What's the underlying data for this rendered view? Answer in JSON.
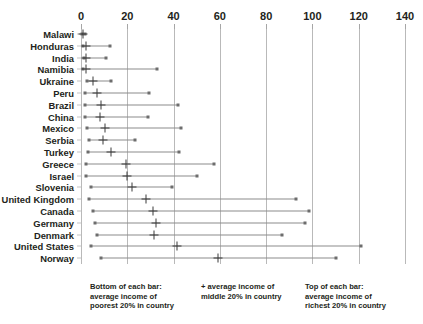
{
  "chart_data": {
    "type": "scatter",
    "title": "",
    "xlabel": "",
    "ylabel": "",
    "xlim": [
      0,
      140
    ],
    "xticks": [
      0,
      20,
      40,
      60,
      80,
      100,
      120,
      140
    ],
    "grid": true,
    "orientation": "horizontal",
    "legend_position": "bottom",
    "categories": [
      "Malawi",
      "Honduras",
      "India",
      "Namibia",
      "Ukraine",
      "Peru",
      "Brazil",
      "China",
      "Mexico",
      "Serbia",
      "Turkey",
      "Greece",
      "Israel",
      "Slovenia",
      "United Kingdom",
      "Canada",
      "Germany",
      "Denmark",
      "United States",
      "Norway"
    ],
    "series": [
      {
        "name": "average income of poorest 20% in country",
        "marker": "square",
        "role": "bar-bottom",
        "values": [
          0.4,
          0.9,
          1.2,
          1.0,
          2.8,
          1.8,
          1.6,
          1.8,
          2.5,
          3.4,
          2.9,
          2.3,
          2.1,
          4.5,
          3.6,
          5.3,
          6.2,
          6.8,
          4.5,
          8.5
        ]
      },
      {
        "name": "average income of middle 20% in country",
        "marker": "plus",
        "role": "bar-middle",
        "values": [
          0.9,
          2.0,
          2.2,
          2.2,
          5.0,
          7.0,
          8.5,
          8.0,
          10.5,
          9.5,
          13.0,
          19.5,
          20.0,
          22.0,
          28.0,
          31.0,
          32.5,
          31.5,
          41.5,
          59.0
        ]
      },
      {
        "name": "average income of richest 20% in country",
        "marker": "square",
        "role": "bar-top",
        "values": [
          1.6,
          12.5,
          11.0,
          33.0,
          13.0,
          29.5,
          42.0,
          29.0,
          43.0,
          23.5,
          42.5,
          57.5,
          50.0,
          39.5,
          93.0,
          98.5,
          97.0,
          87.0,
          121.0,
          110.0
        ]
      }
    ]
  },
  "legend": {
    "block1": {
      "line1": "Bottom of each bar:",
      "line2": "average income of",
      "line3": "poorest 20% in country"
    },
    "block2": {
      "line1": "+ average income of",
      "line2": "middle 20% in country",
      "line3": ""
    },
    "block3": {
      "line1": "Top of each bar:",
      "line2": "average income of",
      "line3": "richest 20% in country"
    }
  }
}
